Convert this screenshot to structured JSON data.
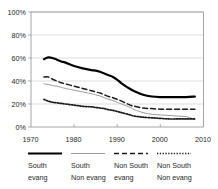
{
  "chart_data": {
    "type": "line",
    "title": "",
    "subtitle": "",
    "xlabel": "",
    "ylabel": "",
    "xlim": [
      1970,
      2010
    ],
    "ylim": [
      0,
      100
    ],
    "grid": true,
    "legend_position": "bottom",
    "y_tick_labels": [
      "100%",
      "80%",
      "60%",
      "40%",
      "20%",
      "0%"
    ],
    "y_tick_values": [
      100,
      80,
      60,
      40,
      20,
      0
    ],
    "x_tick_labels": [
      "1970",
      "1980",
      "1990",
      "2000",
      "2010"
    ],
    "x_tick_values": [
      1970,
      1980,
      1990,
      2000,
      2010
    ],
    "x": [
      1973,
      1974,
      1975,
      1976,
      1977,
      1978,
      1980,
      1982,
      1984,
      1985,
      1986,
      1987,
      1988,
      1989,
      1990,
      1991,
      1993,
      1994,
      1996,
      1998,
      2000,
      2002,
      2004,
      2006,
      2008
    ],
    "series": [
      {
        "name": "South evang",
        "style": "solid-thick-black",
        "color": "#000000",
        "values": [
          59,
          60.5,
          60,
          58.5,
          57,
          56,
          53,
          51,
          49.5,
          49,
          48,
          46.5,
          45,
          43.5,
          41,
          38,
          33,
          31,
          28,
          26.5,
          26,
          26,
          26,
          26,
          26.5
        ]
      },
      {
        "name": "South Non evang",
        "style": "solid-thin-gray",
        "color": "#9a9a9a",
        "values": [
          37.5,
          37,
          36,
          35.5,
          34.5,
          33.5,
          32,
          30.5,
          29,
          28,
          27,
          25.5,
          24,
          23,
          21.5,
          20,
          17,
          15,
          12.5,
          11,
          10.5,
          10,
          9.5,
          9,
          6.5
        ]
      },
      {
        "name": "Non South evang",
        "style": "dashed-black",
        "color": "#1a1a1a",
        "values": [
          43.5,
          43.5,
          41.5,
          40,
          38.5,
          37.5,
          35.5,
          33.5,
          31.5,
          30.5,
          29.5,
          28,
          26.5,
          25.5,
          24,
          22.5,
          19,
          18,
          16.5,
          16,
          15.5,
          15.5,
          15.5,
          15.5,
          15.5
        ]
      },
      {
        "name": "Non South Non evang",
        "style": "dotted-black",
        "color": "#1a1a1a",
        "values": [
          24,
          22.5,
          21.5,
          21,
          20.5,
          20,
          19,
          18,
          17.5,
          17,
          16.5,
          16,
          15,
          14.5,
          13.5,
          12.5,
          10.5,
          9.5,
          8.5,
          8,
          7.5,
          7,
          7,
          7,
          7
        ]
      }
    ]
  },
  "legend": {
    "items": [
      {
        "line1": "South",
        "line2": "evang",
        "style": "solid-thick-black"
      },
      {
        "line1": "South",
        "line2": "Non evang",
        "style": "solid-thin-gray"
      },
      {
        "line1": "Non South",
        "line2": "evang",
        "style": "dashed-black"
      },
      {
        "line1": "Non South",
        "line2": "Non evang",
        "style": "dotted-black"
      }
    ]
  }
}
